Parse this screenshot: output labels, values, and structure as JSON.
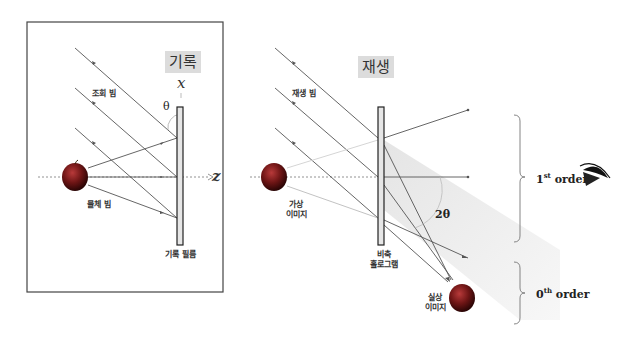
{
  "recording": {
    "title": "기록",
    "axis_x": "x",
    "axis_z": "z",
    "angle": "θ",
    "reference_beam_label": "조회 빔",
    "object_beam_label": "물체 빔",
    "film_label": "기록 필름"
  },
  "reconstruction": {
    "title": "재생",
    "reconstruction_beam_label": "재생 빔",
    "virtual_image_label_1": "가상",
    "virtual_image_label_2": "이미지",
    "hologram_label_1": "비축",
    "hologram_label_2": "홀로그램",
    "angle": "2θ",
    "real_image_label_1": "실상",
    "real_image_label_2": "이미지"
  },
  "orders": {
    "first_base": "1",
    "first_sup": "st",
    "first_word": " order",
    "zeroth_base": "0",
    "zeroth_sup": "th",
    "zeroth_word": " order"
  },
  "colors": {
    "line": "#555555",
    "film_fill": "#e6e6e6",
    "apple": "#8b1a1a",
    "shade": "#ececec"
  }
}
